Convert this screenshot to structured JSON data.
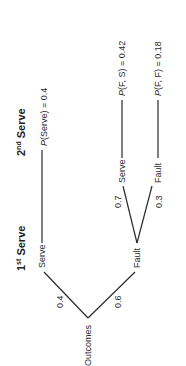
{
  "diagram": {
    "type": "probability-tree",
    "orientation": "rotated-90-ccw",
    "headers": {
      "first": {
        "base": "1",
        "sup": "st",
        "rest": " Serve"
      },
      "second": {
        "base": "2",
        "sup": "nd",
        "rest": " Serve"
      }
    },
    "root": {
      "label": "Outcomes"
    },
    "level1": [
      {
        "label": "Serve",
        "prob": "0.4",
        "result": {
          "italic": "P",
          "text": "(Serve) = 0.4"
        }
      },
      {
        "label": "Fault",
        "prob": "0.6"
      }
    ],
    "level2": [
      {
        "label": "Serve",
        "prob": "0.7",
        "result": {
          "italic": "P",
          "text": "(F, S) = 0.42"
        }
      },
      {
        "label": "Fault",
        "prob": "0.3",
        "result": {
          "italic": "P",
          "text": "(F, F) = 0.18"
        }
      }
    ],
    "colors": {
      "line": "#2a2a2a",
      "text": "#2a2a2a",
      "background": "#ffffff"
    }
  }
}
